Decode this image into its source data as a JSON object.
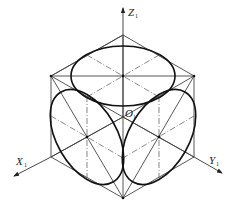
{
  "diagram": {
    "title": "",
    "type": "isometric cube with inscribed ellipses",
    "labels": {
      "z_axis": "Z",
      "z_sub": "1",
      "x_axis": "X",
      "x_sub": "1",
      "y_axis": "Y",
      "y_sub": "1",
      "origin": "O",
      "origin_sub": "1"
    },
    "colors": {
      "line": "#333333",
      "ellipse": "#111111",
      "background": "#ffffff"
    }
  }
}
